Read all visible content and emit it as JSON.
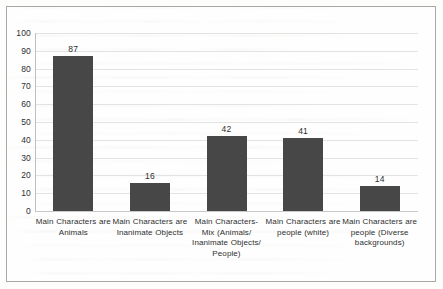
{
  "chart_data": {
    "type": "bar",
    "title": "",
    "subtitle": "",
    "xlabel": "",
    "ylabel": "",
    "ylim": [
      0,
      100
    ],
    "ytick_step": 10,
    "yticks": [
      0,
      10,
      20,
      30,
      40,
      50,
      60,
      70,
      80,
      90,
      100
    ],
    "grid": true,
    "grid_axis": "y",
    "legend": false,
    "legend_position": "none",
    "categories": [
      "Main Characters are Animals",
      "Main Characters are Inanimate Objects",
      "Main Characters- Mix (Animals/ Inanimate Objects/ People)",
      "Main Characters are people (white)",
      "Main Characters are people (Diverse backgrounds)"
    ],
    "category_lines": [
      [
        "Main Characters are",
        "Animals"
      ],
      [
        "Main Characters are",
        "Inanimate Objects"
      ],
      [
        "Main Characters-",
        "Mix (Animals/",
        "Inanimate Objects/",
        "People)"
      ],
      [
        "Main Characters are",
        "people (white)"
      ],
      [
        "Main Characters are",
        "people (Diverse",
        "backgrounds)"
      ]
    ],
    "values": [
      87,
      16,
      42,
      41,
      14
    ],
    "data_labels": [
      "87",
      "16",
      "42",
      "41",
      "14"
    ],
    "bar_color": "#474747",
    "gridline_color": "#e3e3e1",
    "axis_text_color": "#2f2f2f",
    "plot_background": "#fdfdfc",
    "border_color": "#a8a8a8"
  }
}
